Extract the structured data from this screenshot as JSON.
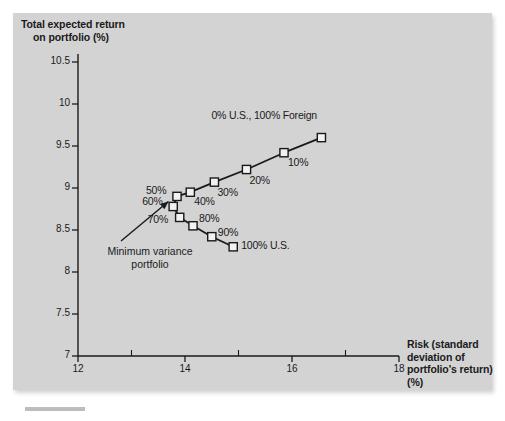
{
  "figure": {
    "background_color": "#d3d3d3",
    "axis_color": "#1a1a1a",
    "marker_face_color": "#f2f2f2",
    "line_color": "#1a1a1a"
  },
  "annotation": {
    "text": "Minimum variance portfolio",
    "line1": "Minimum variance",
    "line2": "portfolio"
  },
  "chart_data": {
    "type": "line",
    "title": "",
    "subtitle": "",
    "xlabel": "Risk (standard deviation of portfolio's return) (%)",
    "ylabel": "Total expected return on portfolio (%)",
    "ylabel_line1": "Total expected return",
    "ylabel_line2": "on portfolio (%)",
    "xlim": [
      12,
      18
    ],
    "ylim": [
      7,
      10.5
    ],
    "xticks": [
      12,
      14,
      16,
      18
    ],
    "xtick_labels": [
      "12",
      "14",
      "16",
      "18"
    ],
    "xminor_ticks": [
      13,
      15,
      17
    ],
    "yticks": [
      7,
      7.5,
      8,
      8.5,
      9,
      9.5,
      10,
      10.5
    ],
    "ytick_labels": [
      "7",
      "7.5",
      "8",
      "8.5",
      "9",
      "9.5",
      "10",
      "10.5"
    ],
    "grid": false,
    "legend": "none",
    "series": [
      {
        "name": "Efficient frontier (U.S. / Foreign portfolio mix)",
        "points": [
          {
            "label": "0% U.S., 100% Foreign",
            "x": 16.55,
            "y": 9.6
          },
          {
            "label": "10%",
            "x": 15.85,
            "y": 9.42
          },
          {
            "label": "20%",
            "x": 15.15,
            "y": 9.22
          },
          {
            "label": "30%",
            "x": 14.55,
            "y": 9.07
          },
          {
            "label": "40%",
            "x": 14.1,
            "y": 8.95
          },
          {
            "label": "50%",
            "x": 13.85,
            "y": 8.9
          },
          {
            "label": "60%",
            "x": 13.78,
            "y": 8.78
          },
          {
            "label": "70%",
            "x": 13.9,
            "y": 8.65
          },
          {
            "label": "80%",
            "x": 14.15,
            "y": 8.55
          },
          {
            "label": "90%",
            "x": 14.5,
            "y": 8.42
          },
          {
            "label": "100% U.S.",
            "x": 14.9,
            "y": 8.3
          }
        ]
      }
    ],
    "point_label_offsets": [
      {
        "label": "0% U.S., 100% Foreign",
        "dx": -110,
        "dy": -22
      },
      {
        "label": "10%",
        "dx": 4,
        "dy": 10
      },
      {
        "label": "20%",
        "dx": 3,
        "dy": 11
      },
      {
        "label": "30%",
        "dx": 3,
        "dy": 11
      },
      {
        "label": "40%",
        "dx": 4,
        "dy": 10
      },
      {
        "label": "50%",
        "dx": -31,
        "dy": -5
      },
      {
        "label": "60%",
        "dx": -31,
        "dy": -4
      },
      {
        "label": "70%",
        "dx": -32,
        "dy": 3
      },
      {
        "label": "80%",
        "dx": 6,
        "dy": -7
      },
      {
        "label": "90%",
        "dx": 6,
        "dy": -4
      },
      {
        "label": "100% U.S.",
        "dx": 8,
        "dy": -1
      }
    ]
  }
}
